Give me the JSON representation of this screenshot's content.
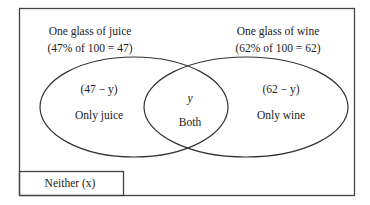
{
  "diagram": {
    "type": "venn",
    "sets": [
      {
        "title": "One glass of juice",
        "subtitle": "(47% of 100 = 47)",
        "region_value": "(47 − y)",
        "region_label": "Only juice"
      },
      {
        "title": "One glass of wine",
        "subtitle": "(62% of 100 = 62)",
        "region_value": "(62 − y)",
        "region_label": "Only wine"
      }
    ],
    "intersection": {
      "value": "y",
      "label": "Both"
    },
    "outside": {
      "label": "Neither (x)"
    }
  },
  "colors": {
    "stroke": "#333333",
    "background": "#ffffff"
  }
}
